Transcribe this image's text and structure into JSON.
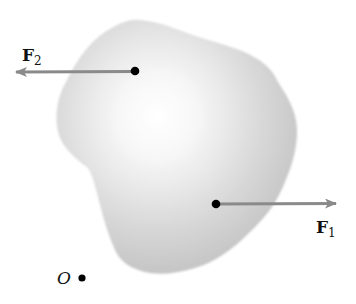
{
  "diagram": {
    "type": "rigid-body-forces",
    "body": {
      "description": "irregular rigid body",
      "fill_center": "#ffffff",
      "fill_edge": "#bdbdbd"
    },
    "forces": [
      {
        "name": "F",
        "subscript": "1",
        "direction": "right",
        "application_point": [
          216,
          204
        ],
        "tip": [
          336,
          204
        ]
      },
      {
        "name": "F",
        "subscript": "2",
        "direction": "left",
        "application_point": [
          135,
          71
        ],
        "tip": [
          14,
          72
        ]
      }
    ],
    "origin": {
      "label": "O",
      "position": [
        82,
        278
      ]
    },
    "colors": {
      "arrow": "#8a8a8a",
      "dot": "#000000",
      "text": "#111111"
    }
  }
}
